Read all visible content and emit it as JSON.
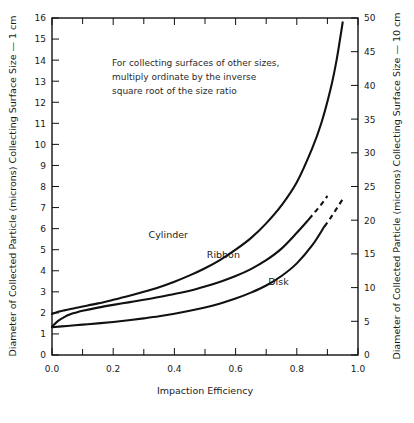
{
  "chart_data": {
    "type": "line",
    "title": "",
    "xlabel": "Impaction Efficiency",
    "ylabel_left": "Diameter  of Collected Particle (microns) Collecting Surface Size  —  1 cm",
    "ylabel_right": "Diameter of Collected Particle (microns) Collecting Surface Size  —  10 cm",
    "xlim": [
      0.0,
      1.0
    ],
    "ylim_left": [
      0,
      16
    ],
    "ylim_right": [
      0,
      50
    ],
    "grid": false,
    "legend": "inline-curve-labels",
    "xticks": [
      0.0,
      0.2,
      0.4,
      0.6,
      0.8,
      1.0
    ],
    "xticklabels": [
      "0.0",
      "0.2",
      "0.4",
      "0.6",
      "0.8",
      "1.0"
    ],
    "xminorticks": [
      0.1,
      0.3,
      0.5,
      0.7,
      0.9
    ],
    "yticks_left": [
      0,
      1,
      2,
      3,
      4,
      5,
      6,
      7,
      8,
      9,
      10,
      11,
      12,
      13,
      14,
      15,
      16
    ],
    "yticklabels_left": [
      "0",
      "1",
      "2",
      "3",
      "4",
      "5",
      "6",
      "7",
      "8",
      "9",
      "10",
      "11",
      "12",
      "13",
      "14",
      "15",
      "16"
    ],
    "yticks_right": [
      0,
      5,
      10,
      15,
      20,
      25,
      30,
      35,
      40,
      45,
      50
    ],
    "yticklabels_right": [
      "0",
      "5",
      "10",
      "15",
      "20",
      "25",
      "30",
      "35",
      "40",
      "45",
      "50"
    ],
    "annotation": [
      "For collecting surfaces of other sizes,",
      "multiply ordinate by the inverse",
      "square root of the size ratio"
    ],
    "series": [
      {
        "name": "Cylinder",
        "label": "Cylinder",
        "style": "solid",
        "x": [
          0.0,
          0.02,
          0.04,
          0.06,
          0.08,
          0.1,
          0.15,
          0.2,
          0.25,
          0.3,
          0.35,
          0.4,
          0.45,
          0.5,
          0.55,
          0.6,
          0.65,
          0.7,
          0.75,
          0.8,
          0.85,
          0.88,
          0.91,
          0.93,
          0.95
        ],
        "values": [
          1.95,
          2.05,
          2.12,
          2.18,
          2.24,
          2.3,
          2.45,
          2.62,
          2.8,
          3.0,
          3.22,
          3.48,
          3.78,
          4.12,
          4.52,
          5.0,
          5.55,
          6.25,
          7.1,
          8.2,
          9.8,
          11.0,
          12.6,
          14.0,
          15.8
        ]
      },
      {
        "name": "Ribbon",
        "label": "Ribbon",
        "style": "solid-then-dashed",
        "x": [
          0.0,
          0.02,
          0.04,
          0.06,
          0.08,
          0.1,
          0.15,
          0.2,
          0.25,
          0.3,
          0.35,
          0.4,
          0.45,
          0.5,
          0.55,
          0.6,
          0.65,
          0.7,
          0.75,
          0.8,
          0.84
        ],
        "values": [
          1.35,
          1.62,
          1.8,
          1.93,
          2.02,
          2.1,
          2.25,
          2.38,
          2.5,
          2.62,
          2.75,
          2.9,
          3.05,
          3.25,
          3.48,
          3.75,
          4.08,
          4.5,
          5.05,
          5.8,
          6.45
        ],
        "dashed_x": [
          0.84,
          0.86,
          0.88,
          0.9
        ],
        "dashed_values": [
          6.45,
          6.8,
          7.15,
          7.55
        ]
      },
      {
        "name": "Disk",
        "label": "Disk",
        "style": "solid-then-dashed",
        "x": [
          0.0,
          0.05,
          0.1,
          0.15,
          0.2,
          0.25,
          0.3,
          0.35,
          0.4,
          0.45,
          0.5,
          0.55,
          0.6,
          0.65,
          0.7,
          0.75,
          0.8,
          0.85,
          0.89
        ],
        "values": [
          1.32,
          1.38,
          1.44,
          1.5,
          1.57,
          1.65,
          1.74,
          1.84,
          1.96,
          2.1,
          2.26,
          2.45,
          2.68,
          2.96,
          3.3,
          3.75,
          4.35,
          5.2,
          6.1
        ],
        "dashed_x": [
          0.89,
          0.91,
          0.93,
          0.95
        ],
        "dashed_values": [
          6.1,
          6.5,
          6.95,
          7.4
        ]
      }
    ],
    "curve_label_positions": [
      {
        "name": "Cylinder",
        "x": 0.38,
        "y": 5.55
      },
      {
        "name": "Ribbon",
        "x": 0.56,
        "y": 4.6
      },
      {
        "name": "Disk",
        "x": 0.74,
        "y": 3.3
      }
    ]
  }
}
